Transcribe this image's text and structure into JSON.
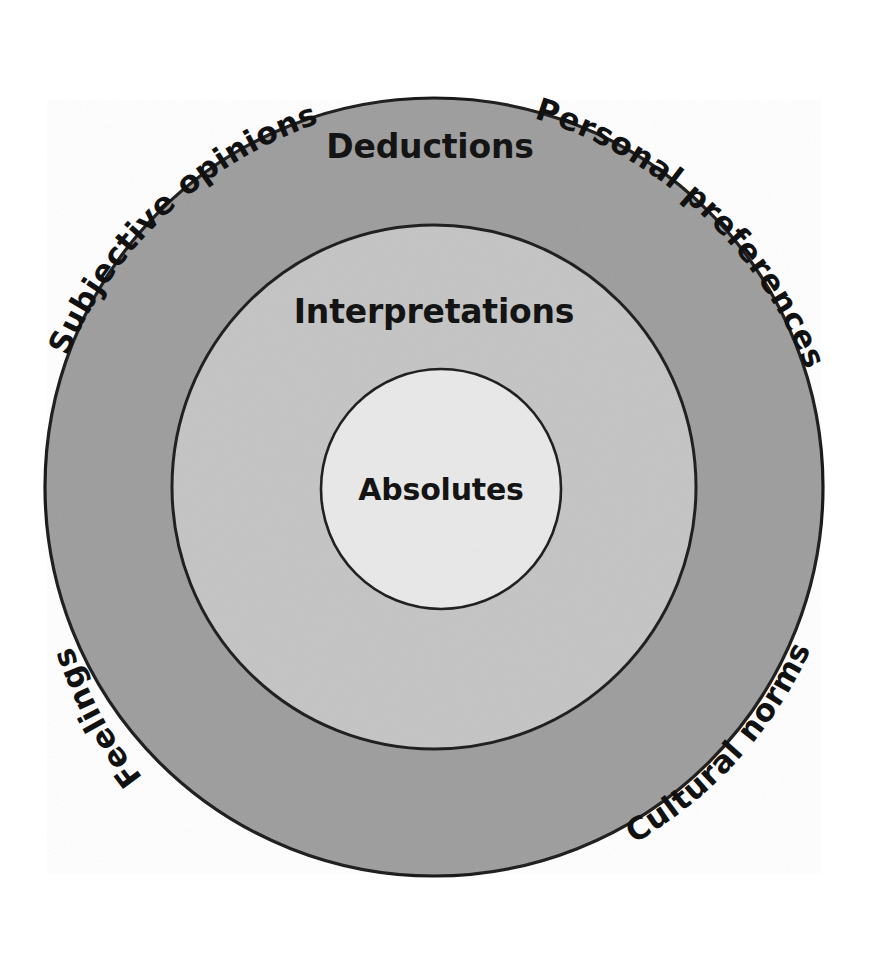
{
  "diagram": {
    "type": "concentric-circles",
    "title": "",
    "background_color": "#ffffff",
    "rings": [
      {
        "id": "outer",
        "label": "Deductions",
        "fill_color": "#9d9d9d",
        "stroke_color": "#1a1a1a",
        "radius": 389,
        "label_x": 430,
        "label_y": 158
      },
      {
        "id": "middle",
        "label": "Interpretations",
        "fill_color": "#c4c4c4",
        "stroke_color": "#1a1a1a",
        "radius": 262,
        "label_x": 434,
        "label_y": 323
      },
      {
        "id": "inner",
        "label": "Absolutes",
        "fill_color": "#e9e9e9",
        "stroke_color": "#1a1a1a",
        "radius": 120,
        "label_x": 441,
        "label_y": 500
      }
    ],
    "center": {
      "x": 434,
      "y": 487
    },
    "external_labels": [
      {
        "id": "subjective-opinions",
        "text": "Subjective opinions",
        "position": "upper-left",
        "color": "#111111"
      },
      {
        "id": "personal-preferences",
        "text": "Personal preferences",
        "position": "upper-right",
        "color": "#111111"
      },
      {
        "id": "feelings",
        "text": "Feelings",
        "position": "lower-left",
        "color": "#111111"
      },
      {
        "id": "cultural-norms",
        "text": "Cultural norms",
        "position": "lower-right",
        "color": "#111111"
      }
    ]
  }
}
